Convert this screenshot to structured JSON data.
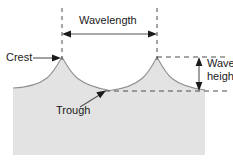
{
  "figure": {
    "type": "diagram"
  },
  "labels": {
    "crest": "Crest",
    "trough": "Trough",
    "wavelength": "Wavelength",
    "wave_height_line1": "Wave",
    "wave_height_line2": "height"
  },
  "colors": {
    "water_fill": "#e3e3e3",
    "water_stroke": "#8c8c8c",
    "line": "#4d4d4d",
    "dashed": "#4d4d4d",
    "text": "#1a1a1a",
    "background": "#ffffff"
  },
  "geometry": {
    "crest_level_y": 57,
    "trough_level_y": 91,
    "crest1_x": 62,
    "crest2_x": 157,
    "wavelength_px": 95,
    "wave_height_px": 34,
    "water_left_x": 13,
    "water_right_x": 205,
    "water_bottom_y": 155
  }
}
